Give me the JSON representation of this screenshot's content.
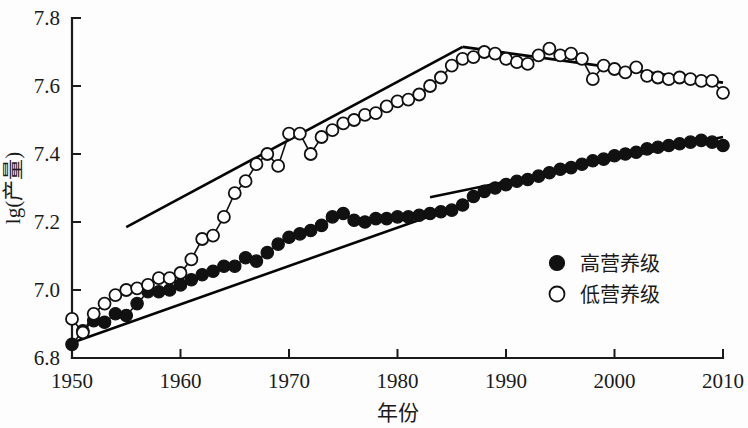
{
  "chart_data": {
    "type": "line",
    "title": "",
    "xlabel": "年份",
    "ylabel": "lg(产量)",
    "xlim": [
      1950,
      2010
    ],
    "ylim": [
      6.8,
      7.8
    ],
    "xticks": [
      1950,
      1960,
      1970,
      1980,
      1990,
      2000,
      2010
    ],
    "xticklabels": [
      "1950",
      "1960",
      "1970",
      "1980",
      "1990",
      "2000",
      "2010"
    ],
    "yticks": [
      6.8,
      7.0,
      7.2,
      7.4,
      7.6,
      7.8
    ],
    "yticklabels": [
      "6.8",
      "7.0",
      "7.2",
      "7.4",
      "7.6",
      "7.8"
    ],
    "grid": false,
    "legend_position": "lower-right",
    "x": [
      1950,
      1951,
      1952,
      1953,
      1954,
      1955,
      1956,
      1957,
      1958,
      1959,
      1960,
      1961,
      1962,
      1963,
      1964,
      1965,
      1966,
      1967,
      1968,
      1969,
      1970,
      1971,
      1972,
      1973,
      1974,
      1975,
      1976,
      1977,
      1978,
      1979,
      1980,
      1981,
      1982,
      1983,
      1984,
      1985,
      1986,
      1987,
      1988,
      1989,
      1990,
      1991,
      1992,
      1993,
      1994,
      1995,
      1996,
      1997,
      1998,
      1999,
      2000,
      2001,
      2002,
      2003,
      2004,
      2005,
      2006,
      2007,
      2008,
      2009,
      2010
    ],
    "series": [
      {
        "name": "高营养级",
        "marker": "filled-circle",
        "values": [
          6.84,
          6.88,
          6.91,
          6.905,
          6.93,
          6.925,
          6.96,
          6.995,
          6.995,
          7.0,
          7.015,
          7.03,
          7.045,
          7.055,
          7.07,
          7.07,
          7.095,
          7.085,
          7.11,
          7.135,
          7.155,
          7.165,
          7.175,
          7.19,
          7.215,
          7.225,
          7.205,
          7.2,
          7.21,
          7.21,
          7.215,
          7.215,
          7.22,
          7.225,
          7.23,
          7.235,
          7.25,
          7.275,
          7.29,
          7.3,
          7.31,
          7.32,
          7.325,
          7.335,
          7.345,
          7.355,
          7.36,
          7.37,
          7.38,
          7.385,
          7.395,
          7.4,
          7.405,
          7.415,
          7.42,
          7.425,
          7.43,
          7.435,
          7.44,
          7.435,
          7.425
        ]
      },
      {
        "name": "低营养级",
        "marker": "open-circle",
        "values": [
          6.915,
          6.875,
          6.93,
          6.96,
          6.985,
          7.0,
          7.005,
          7.015,
          7.035,
          7.035,
          7.05,
          7.09,
          7.15,
          7.16,
          7.215,
          7.285,
          7.32,
          7.37,
          7.4,
          7.365,
          7.46,
          7.46,
          7.4,
          7.45,
          7.47,
          7.49,
          7.5,
          7.515,
          7.52,
          7.54,
          7.555,
          7.56,
          7.575,
          7.6,
          7.625,
          7.66,
          7.68,
          7.685,
          7.7,
          7.695,
          7.68,
          7.67,
          7.665,
          7.69,
          7.71,
          7.69,
          7.695,
          7.68,
          7.62,
          7.66,
          7.65,
          7.64,
          7.655,
          7.63,
          7.625,
          7.62,
          7.625,
          7.62,
          7.615,
          7.615,
          7.58
        ]
      }
    ],
    "trend_lines": [
      {
        "series": "低营养级",
        "segment": "rising",
        "x": [
          1955,
          1986
        ],
        "y": [
          7.185,
          7.715
        ]
      },
      {
        "series": "低营养级",
        "segment": "falling",
        "x": [
          1986,
          2010
        ],
        "y": [
          7.715,
          7.61
        ]
      },
      {
        "series": "高营养级",
        "segment": "early",
        "x": [
          1950,
          1985
        ],
        "y": [
          6.845,
          7.24
        ]
      },
      {
        "series": "高营养级",
        "segment": "late",
        "x": [
          1983,
          2010
        ],
        "y": [
          7.273,
          7.45
        ]
      }
    ]
  },
  "legend": {
    "items": [
      {
        "label": "高营养级",
        "marker": "filled-circle"
      },
      {
        "label": "低营养级",
        "marker": "open-circle"
      }
    ]
  }
}
